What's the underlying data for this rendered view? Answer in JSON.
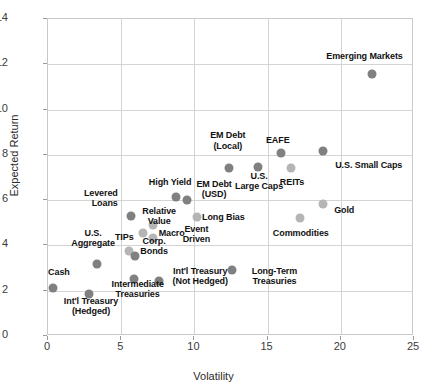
{
  "chart_data": {
    "type": "scatter",
    "title": "",
    "xlabel": "Volatility",
    "ylabel": "Expected Return",
    "xlim": [
      0,
      25
    ],
    "ylim": [
      0,
      14
    ],
    "xticks": [
      "0",
      "5",
      "10",
      "15",
      "20",
      "25"
    ],
    "yticks": [
      "0",
      "2",
      "4",
      "6",
      "8",
      "10",
      "12",
      "14"
    ],
    "grid": true,
    "legend": "none",
    "colors": {
      "marker_dark": "#808080",
      "marker_light": "#b5b5b5",
      "gridline": "#d4d4d4",
      "axis_text": "#3b3b3b",
      "label_text": "#111111"
    },
    "points": [
      {
        "label": "Cash",
        "x": 0.35,
        "y": 2.1,
        "shade": "dark"
      },
      {
        "label": "Int'l Treasury\n(Hedged)",
        "x": 2.8,
        "y": 1.85,
        "shade": "dark"
      },
      {
        "label": "U.S.\nAggregate",
        "x": 3.35,
        "y": 3.2,
        "shade": "dark"
      },
      {
        "label": "TIPs",
        "x": 5.55,
        "y": 3.75,
        "shade": "light"
      },
      {
        "label": "Corp.\nBonds",
        "x": 5.95,
        "y": 3.55,
        "shade": "dark"
      },
      {
        "label": "Intermediate\nTreasuries",
        "x": 5.85,
        "y": 2.5,
        "shade": "dark"
      },
      {
        "label": "Int'l Treasury\n(Not Hedged)",
        "x": 7.6,
        "y": 2.45,
        "shade": "dark"
      },
      {
        "label": "Levered\nLoans",
        "x": 5.65,
        "y": 5.3,
        "shade": "dark"
      },
      {
        "label": "Relative\nValue",
        "x": 6.5,
        "y": 4.55,
        "shade": "light"
      },
      {
        "label": "Event\nDriven",
        "x": 7.2,
        "y": 4.35,
        "shade": "light"
      },
      {
        "label": "Macro",
        "x": 7.15,
        "y": 4.9,
        "shade": "light"
      },
      {
        "label": "High Yield",
        "x": 8.75,
        "y": 6.15,
        "shade": "dark"
      },
      {
        "label": "EM Debt\n(USD)",
        "x": 9.5,
        "y": 6.0,
        "shade": "dark"
      },
      {
        "label": "Long Bias",
        "x": 10.2,
        "y": 5.25,
        "shade": "light"
      },
      {
        "label": "Long-Term\nTreasuries",
        "x": 12.6,
        "y": 2.9,
        "shade": "dark"
      },
      {
        "label": "EM Debt\n(Local)",
        "x": 12.35,
        "y": 7.4,
        "shade": "dark"
      },
      {
        "label": "U.S.\nLarge Caps",
        "x": 14.35,
        "y": 7.45,
        "shade": "dark"
      },
      {
        "label": "EAFE",
        "x": 15.9,
        "y": 8.1,
        "shade": "dark"
      },
      {
        "label": "REITs",
        "x": 16.6,
        "y": 7.4,
        "shade": "light"
      },
      {
        "label": "Commodities",
        "x": 17.2,
        "y": 5.2,
        "shade": "light"
      },
      {
        "label": "Gold",
        "x": 18.8,
        "y": 5.85,
        "shade": "light"
      },
      {
        "label": "U.S. Small Caps",
        "x": 18.8,
        "y": 8.15,
        "shade": "dark"
      },
      {
        "label": "Emerging Markets",
        "x": 22.1,
        "y": 11.55,
        "shade": "dark"
      }
    ]
  },
  "labels": {
    "cash": "Cash",
    "intl_treasury_hedged": "Int'l Treasury\n(Hedged)",
    "us_aggregate": "U.S.\nAggregate",
    "tips": "TIPs",
    "corp_bonds": "Corp.\nBonds",
    "intermediate_treasuries": "Intermediate\nTreasuries",
    "intl_treasury_not_hedged": "Int'l Treasury\n(Not Hedged)",
    "levered_loans": "Levered\nLoans",
    "relative_value": "Relative\nValue",
    "event_driven": "Event\nDriven",
    "macro": "Macro",
    "high_yield": "High Yield",
    "em_debt_usd": "EM Debt\n(USD)",
    "long_bias": "Long Bias",
    "long_term_treasuries": "Long-Term\nTreasuries",
    "em_debt_local": "EM Debt\n(Local)",
    "us_large_caps": "U.S.\nLarge Caps",
    "eafe": "EAFE",
    "reits": "REITs",
    "commodities": "Commodities",
    "gold": "Gold",
    "us_small_caps": "U.S. Small Caps",
    "emerging_markets": "Emerging Markets"
  },
  "axes": {
    "x_title": "Volatility",
    "y_title": "Expected Return"
  }
}
